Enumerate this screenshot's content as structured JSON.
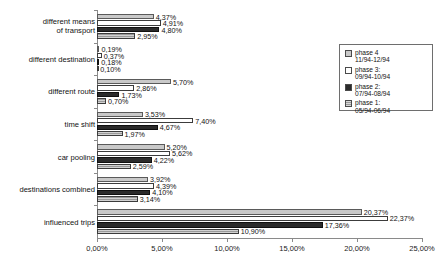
{
  "chart_data": {
    "type": "bar",
    "orientation": "horizontal",
    "title": "",
    "xlabel": "",
    "ylabel": "",
    "xlim": [
      0,
      25
    ],
    "xticks": [
      0,
      5,
      10,
      15,
      20,
      25
    ],
    "xtick_labels": [
      "0,00%",
      "5,00%",
      "10,00%",
      "15,00%",
      "20,00%",
      "25,00%"
    ],
    "grid": false,
    "legend_position": "right-top",
    "categories": [
      "different means\nof transport",
      "different destination",
      "different route",
      "time shift",
      "car pooling",
      "destinations combined",
      "influenced trips"
    ],
    "series": [
      {
        "name": "phase 4",
        "period": "11/94-12/94",
        "fill": "light-gray",
        "color": "#c9c9c9",
        "values": [
          4.37,
          0.19,
          5.7,
          3.53,
          5.2,
          3.92,
          20.37
        ],
        "labels": [
          "4,37%",
          "0,19%",
          "5,70%",
          "3,53%",
          "5,20%",
          "3,92%",
          "20,37%"
        ]
      },
      {
        "name": "phase 3",
        "period": "09/94-10/94",
        "fill": "white",
        "color": "#ffffff",
        "values": [
          4.91,
          0.37,
          2.86,
          7.4,
          5.62,
          4.39,
          22.37
        ],
        "labels": [
          "4,91%",
          "0,37%",
          "2,86%",
          "7,40%",
          "5,62%",
          "4,39%",
          "22,37%"
        ]
      },
      {
        "name": "phase 2",
        "period": "07/94-08/94",
        "fill": "black",
        "color": "#2b2b2b",
        "values": [
          4.8,
          0.18,
          1.73,
          4.67,
          4.22,
          4.1,
          17.36
        ],
        "labels": [
          "4,80%",
          "0,18%",
          "1,73%",
          "4,67%",
          "4,22%",
          "4,10%",
          "17,36%"
        ]
      },
      {
        "name": "phase 1",
        "period": "05/94-06/94",
        "fill": "hatched-gray",
        "color": "#9a9a9a",
        "values": [
          2.95,
          0.1,
          0.7,
          1.97,
          2.59,
          3.14,
          10.9
        ],
        "labels": [
          "2,95%",
          "0,10%",
          "0,70%",
          "1,97%",
          "2,59%",
          "3,14%",
          "10,90%"
        ]
      }
    ]
  },
  "legend": {
    "items": [
      {
        "label": "phase 4\n11/94-12/94",
        "swatch": "p4"
      },
      {
        "label": "phase 3:\n09/94-10/94",
        "swatch": "p3"
      },
      {
        "label": "phase 2:\n07/94-08/94",
        "swatch": "p2"
      },
      {
        "label": "phase 1:\n05/94-06/94",
        "swatch": "p1"
      }
    ]
  }
}
